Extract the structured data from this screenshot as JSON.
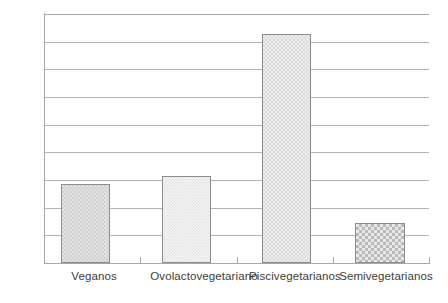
{
  "chart_data": {
    "type": "bar",
    "title": "",
    "subtitle": "",
    "xlabel": "",
    "ylabel": "",
    "categories": [
      "Veganos",
      "Ovolactovegetariano",
      "Piscivegetarianos",
      "Semivegetarianos"
    ],
    "values": [
      14.3,
      15.8,
      41.4,
      7.2
    ],
    "ylim": [
      0,
      45
    ],
    "ytick_labels": [
      "45",
      "40",
      "35",
      "30",
      "25",
      "20",
      "15",
      "10",
      "5",
      "0"
    ],
    "ytick_values": [
      45,
      40,
      35,
      30,
      25,
      20,
      15,
      10,
      5,
      0
    ],
    "ytick_step": 5,
    "grid": true,
    "grid_axis": "y",
    "legend": false,
    "legend_position": "none",
    "series": [
      {
        "name": "",
        "values": [
          14.3,
          15.8,
          41.4,
          7.2
        ]
      }
    ],
    "bar_styles": [
      {
        "category": "Veganos",
        "pattern": "checker-medium",
        "fill": "#e2e2e2",
        "border": "#8c8c8c"
      },
      {
        "category": "Ovolactovegetariano",
        "pattern": "speckle-light",
        "fill": "#f5f5f5",
        "border": "#8c8c8c"
      },
      {
        "category": "Piscivegetarianos",
        "pattern": "checker-light",
        "fill": "#eeeeee",
        "border": "#8c8c8c"
      },
      {
        "category": "Semivegetarianos",
        "pattern": "checker-dark",
        "fill": "#e8e8e8",
        "border": "#8c8c8c"
      }
    ],
    "colors": {
      "background": "#ffffff",
      "axis": "#a8a8a8",
      "grid": "#b4b4b4",
      "text": "#3d3d3d",
      "bar_border": "#8c8c8c"
    }
  }
}
